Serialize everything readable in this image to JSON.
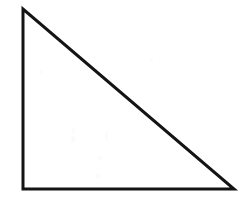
{
  "figure": {
    "type": "geometric-diagram",
    "shape_name": "right-triangle",
    "title": "",
    "caption": "",
    "background_color": "#ffffff",
    "stroke_color": "#141414",
    "stroke_width_px": 3,
    "fill_color": "none",
    "canvas": {
      "width_px": 248,
      "height_px": 197
    },
    "vertices": [
      {
        "label": "",
        "name": "apex-top-left",
        "x": 23,
        "y": 9
      },
      {
        "label": "",
        "name": "right-angle-bottom-left",
        "x": 23,
        "y": 189
      },
      {
        "label": "",
        "name": "vertex-bottom-right",
        "x": 234,
        "y": 189
      }
    ],
    "edges": [
      {
        "name": "vertical-leg",
        "from": "apex-top-left",
        "to": "right-angle-bottom-left",
        "length_px": 180
      },
      {
        "name": "horizontal-leg",
        "from": "right-angle-bottom-left",
        "to": "vertex-bottom-right",
        "length_px": 211
      },
      {
        "name": "hypotenuse",
        "from": "vertex-bottom-right",
        "to": "apex-top-left",
        "length_px": 277
      }
    ],
    "right_angle_at": "right-angle-bottom-left",
    "annotations": [],
    "labels": [],
    "speckles": [
      {
        "x": 72,
        "y": 128,
        "w": 3,
        "h": 5
      },
      {
        "x": 71,
        "y": 136,
        "w": 4,
        "h": 7
      },
      {
        "x": 105,
        "y": 131,
        "w": 3,
        "h": 9
      },
      {
        "x": 98,
        "y": 156,
        "w": 4,
        "h": 4
      },
      {
        "x": 96,
        "y": 174,
        "w": 4,
        "h": 4
      },
      {
        "x": 150,
        "y": 58,
        "w": 3,
        "h": 3
      },
      {
        "x": 196,
        "y": 150,
        "w": 3,
        "h": 3
      },
      {
        "x": 40,
        "y": 70,
        "w": 2,
        "h": 4
      }
    ]
  }
}
